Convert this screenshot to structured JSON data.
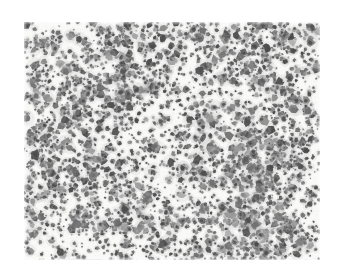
{
  "figure": {
    "kind": "micrograph",
    "canvas": {
      "width": 343,
      "height": 278,
      "page_background": "#ffffff"
    },
    "image_area": {
      "x": 24,
      "y": 22,
      "width": 296,
      "height": 238
    },
    "colors": {
      "plate_background": "#f9f9f8",
      "particle_dark": "#4a4a4a",
      "particle_mid": "#6e6e6e",
      "particle_light": "#9a9a9a",
      "halo": "#c8c8c8",
      "page_background": "#ffffff"
    },
    "texture": {
      "seed": 20240517,
      "particle_count": 3100,
      "radius_min": 0.7,
      "radius_max": 4.6,
      "cluster_count": 150,
      "cluster_spread": 13,
      "cluster_member_min": 3,
      "cluster_member_max": 14,
      "blur_px": 0.45,
      "grain_opacity": 0.1,
      "bottom_band_y": 236,
      "bottom_band_height": 4
    },
    "density_hotspots": [
      {
        "x": 0.82,
        "y": 0.13,
        "strength": 1.0
      },
      {
        "x": 0.16,
        "y": 0.22,
        "strength": 0.85
      },
      {
        "x": 0.45,
        "y": 0.08,
        "strength": 0.7
      },
      {
        "x": 0.09,
        "y": 0.56,
        "strength": 0.75
      },
      {
        "x": 0.88,
        "y": 0.52,
        "strength": 0.8
      },
      {
        "x": 0.3,
        "y": 0.8,
        "strength": 0.8
      },
      {
        "x": 0.76,
        "y": 0.88,
        "strength": 1.0
      },
      {
        "x": 0.55,
        "y": 0.45,
        "strength": 0.45
      },
      {
        "x": 0.62,
        "y": 0.7,
        "strength": 0.6
      },
      {
        "x": 0.38,
        "y": 0.34,
        "strength": 0.6
      }
    ],
    "sparse_zones": [
      {
        "x": 0.58,
        "y": 0.22,
        "strength": 0.55
      },
      {
        "x": 0.5,
        "y": 0.62,
        "strength": 0.5
      },
      {
        "x": 0.2,
        "y": 0.42,
        "strength": 0.35
      }
    ]
  }
}
